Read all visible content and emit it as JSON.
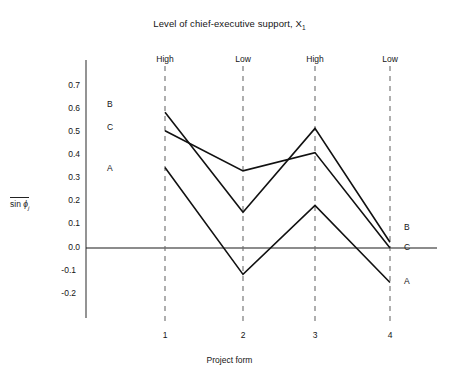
{
  "chart_data": {
    "type": "line",
    "title": "Level of chief-executive support, X",
    "title_subscript": "1",
    "xlabel": "Project form",
    "ylabel_prefix": "sin",
    "ylabel_symbol": "ϕ",
    "ylabel_subscript": "j",
    "categories": [
      "1",
      "2",
      "3",
      "4"
    ],
    "group_labels": [
      "High",
      "Low",
      "High",
      "Low"
    ],
    "series": [
      {
        "name": "B",
        "values": [
          0.59,
          0.155,
          0.52,
          0.025
        ]
      },
      {
        "name": "C",
        "values": [
          0.51,
          0.335,
          0.415,
          0.0
        ]
      },
      {
        "name": "A",
        "values": [
          0.35,
          -0.115,
          0.185,
          -0.15
        ]
      }
    ],
    "yticks": [
      "0.7",
      "0.6",
      "0.5",
      "0.4",
      "0.3",
      "0.2",
      "0.1",
      "0.0",
      "-0.1",
      "-0.2"
    ],
    "ylim": [
      -0.2,
      0.7
    ],
    "grid": false,
    "legend_position": "inline-left-right",
    "left_labels": [
      "B",
      "C",
      "A"
    ],
    "right_labels": [
      "B",
      "C",
      "A"
    ],
    "line_color": "#111111",
    "axis_color": "#3c3c3c",
    "dash_color": "#6d6d6d",
    "background": "#ffffff"
  }
}
